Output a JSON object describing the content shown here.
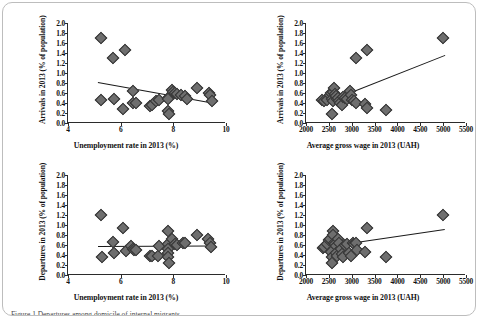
{
  "figure": {
    "caption": "Figure 1 Departures among domicile of internal migrants",
    "panel_count": 4
  },
  "chart_data": [
    {
      "id": "arrivals-vs-unemployment",
      "type": "scatter",
      "position": "top-left",
      "title": "",
      "xlabel": "Unemployment rate in 2013 (%)",
      "ylabel": "Arrivals in 2013  (% of population)",
      "xlim": [
        4,
        10
      ],
      "ylim": [
        0,
        2.0
      ],
      "xticks": [
        4,
        6,
        8,
        10
      ],
      "yticks": [
        0.0,
        0.2,
        0.4,
        0.6,
        0.8,
        1.0,
        1.2,
        1.4,
        1.6,
        1.8,
        2.0
      ],
      "grid": false,
      "legend": "none",
      "marker": "diamond",
      "points": [
        {
          "x": 5.25,
          "y": 1.71
        },
        {
          "x": 5.7,
          "y": 1.3
        },
        {
          "x": 6.15,
          "y": 1.46
        },
        {
          "x": 5.25,
          "y": 0.47
        },
        {
          "x": 5.75,
          "y": 0.49
        },
        {
          "x": 6.1,
          "y": 0.29
        },
        {
          "x": 6.45,
          "y": 0.65
        },
        {
          "x": 6.45,
          "y": 0.4
        },
        {
          "x": 6.6,
          "y": 0.4
        },
        {
          "x": 7.1,
          "y": 0.35
        },
        {
          "x": 7.2,
          "y": 0.37
        },
        {
          "x": 7.35,
          "y": 0.45
        },
        {
          "x": 7.45,
          "y": 0.47
        },
        {
          "x": 7.8,
          "y": 0.5
        },
        {
          "x": 7.8,
          "y": 0.49
        },
        {
          "x": 7.8,
          "y": 0.24
        },
        {
          "x": 7.82,
          "y": 0.18
        },
        {
          "x": 7.95,
          "y": 0.66
        },
        {
          "x": 7.98,
          "y": 0.63
        },
        {
          "x": 8.05,
          "y": 0.6
        },
        {
          "x": 8.15,
          "y": 0.58
        },
        {
          "x": 8.3,
          "y": 0.56
        },
        {
          "x": 8.45,
          "y": 0.55
        },
        {
          "x": 8.5,
          "y": 0.48
        },
        {
          "x": 8.9,
          "y": 0.7
        },
        {
          "x": 9.35,
          "y": 0.6
        },
        {
          "x": 9.4,
          "y": 0.56
        },
        {
          "x": 9.45,
          "y": 0.45
        }
      ],
      "trendline": {
        "x1": 5.15,
        "y1": 0.82,
        "x2": 9.5,
        "y2": 0.41
      }
    },
    {
      "id": "arrivals-vs-wage",
      "type": "scatter",
      "position": "top-right",
      "title": "",
      "xlabel": "Average gross wage in 2013 (UAH)",
      "ylabel": "Arrivals in 2013  (% of population)",
      "xlim": [
        2000,
        5500
      ],
      "ylim": [
        0,
        2.0
      ],
      "xticks": [
        2000,
        2500,
        3000,
        3500,
        4000,
        4500,
        5000,
        5500
      ],
      "yticks": [
        0.0,
        0.2,
        0.4,
        0.6,
        0.8,
        1.0,
        1.2,
        1.4,
        1.6,
        1.8,
        2.0
      ],
      "grid": false,
      "legend": "none",
      "marker": "diamond",
      "points": [
        {
          "x": 5000,
          "y": 1.71
        },
        {
          "x": 3100,
          "y": 1.3
        },
        {
          "x": 3330,
          "y": 1.46
        },
        {
          "x": 2360,
          "y": 0.47
        },
        {
          "x": 2400,
          "y": 0.45
        },
        {
          "x": 2460,
          "y": 0.47
        },
        {
          "x": 2520,
          "y": 0.56
        },
        {
          "x": 2540,
          "y": 0.6
        },
        {
          "x": 2560,
          "y": 0.49
        },
        {
          "x": 2580,
          "y": 0.45
        },
        {
          "x": 2600,
          "y": 0.63
        },
        {
          "x": 2620,
          "y": 0.7
        },
        {
          "x": 2640,
          "y": 0.58
        },
        {
          "x": 2650,
          "y": 0.55
        },
        {
          "x": 2680,
          "y": 0.48
        },
        {
          "x": 2700,
          "y": 0.5
        },
        {
          "x": 2720,
          "y": 0.44
        },
        {
          "x": 2750,
          "y": 0.4
        },
        {
          "x": 2780,
          "y": 0.37
        },
        {
          "x": 2820,
          "y": 0.52
        },
        {
          "x": 2860,
          "y": 0.5
        },
        {
          "x": 2900,
          "y": 0.49
        },
        {
          "x": 2960,
          "y": 0.65
        },
        {
          "x": 2980,
          "y": 0.56
        },
        {
          "x": 3000,
          "y": 0.47
        },
        {
          "x": 3050,
          "y": 0.45
        },
        {
          "x": 3100,
          "y": 0.4
        },
        {
          "x": 3300,
          "y": 0.38
        },
        {
          "x": 3330,
          "y": 0.3
        },
        {
          "x": 2560,
          "y": 0.18
        },
        {
          "x": 3750,
          "y": 0.26
        }
      ],
      "trendline": {
        "x1": 2980,
        "y1": 0.62,
        "x2": 5030,
        "y2": 1.36
      }
    },
    {
      "id": "departures-vs-unemployment",
      "type": "scatter",
      "position": "bottom-left",
      "title": "",
      "xlabel": "Unemployment rate in 2013 (%)",
      "ylabel": "Departures in 2013 (% of population)",
      "xlim": [
        4,
        10
      ],
      "ylim": [
        0,
        2.0
      ],
      "xticks": [
        4,
        6,
        8,
        10
      ],
      "yticks": [
        0.0,
        0.2,
        0.4,
        0.6,
        0.8,
        1.0,
        1.2,
        1.4,
        1.6,
        1.8,
        2.0
      ],
      "grid": false,
      "legend": "none",
      "marker": "diamond",
      "points": [
        {
          "x": 5.25,
          "y": 1.21
        },
        {
          "x": 5.3,
          "y": 0.37
        },
        {
          "x": 5.7,
          "y": 0.67
        },
        {
          "x": 5.75,
          "y": 0.45
        },
        {
          "x": 6.1,
          "y": 0.95
        },
        {
          "x": 6.2,
          "y": 0.48
        },
        {
          "x": 6.4,
          "y": 0.59
        },
        {
          "x": 6.45,
          "y": 0.52
        },
        {
          "x": 6.5,
          "y": 0.5
        },
        {
          "x": 6.6,
          "y": 0.5
        },
        {
          "x": 7.1,
          "y": 0.38
        },
        {
          "x": 7.2,
          "y": 0.38
        },
        {
          "x": 7.4,
          "y": 0.38
        },
        {
          "x": 7.45,
          "y": 0.59
        },
        {
          "x": 7.8,
          "y": 0.88
        },
        {
          "x": 7.8,
          "y": 0.62
        },
        {
          "x": 7.8,
          "y": 0.52
        },
        {
          "x": 7.8,
          "y": 0.44
        },
        {
          "x": 7.8,
          "y": 0.36
        },
        {
          "x": 7.82,
          "y": 0.25
        },
        {
          "x": 7.95,
          "y": 0.72
        },
        {
          "x": 8.05,
          "y": 0.63
        },
        {
          "x": 8.15,
          "y": 0.6
        },
        {
          "x": 8.35,
          "y": 0.65
        },
        {
          "x": 8.45,
          "y": 0.65
        },
        {
          "x": 8.9,
          "y": 0.8
        },
        {
          "x": 9.3,
          "y": 0.72
        },
        {
          "x": 9.4,
          "y": 0.65
        },
        {
          "x": 9.42,
          "y": 0.57
        }
      ],
      "trendline": {
        "x1": 5.15,
        "y1": 0.59,
        "x2": 9.5,
        "y2": 0.6
      }
    },
    {
      "id": "departures-vs-wage",
      "type": "scatter",
      "position": "bottom-right",
      "title": "",
      "xlabel": "Average gross wage in 2013 (UAH)",
      "ylabel": "Departures in 2013 (% of population)",
      "xlim": [
        2000,
        5500
      ],
      "ylim": [
        0,
        2.0
      ],
      "xticks": [
        2000,
        2500,
        3000,
        3500,
        4000,
        4500,
        5000,
        5500
      ],
      "yticks": [
        0.0,
        0.2,
        0.4,
        0.6,
        0.8,
        1.0,
        1.2,
        1.4,
        1.6,
        1.8,
        2.0
      ],
      "grid": false,
      "legend": "none",
      "marker": "diamond",
      "points": [
        {
          "x": 5000,
          "y": 1.21
        },
        {
          "x": 3330,
          "y": 0.95
        },
        {
          "x": 2370,
          "y": 0.55
        },
        {
          "x": 2400,
          "y": 0.57
        },
        {
          "x": 2460,
          "y": 0.62
        },
        {
          "x": 2500,
          "y": 0.7
        },
        {
          "x": 2520,
          "y": 0.72
        },
        {
          "x": 2540,
          "y": 0.47
        },
        {
          "x": 2560,
          "y": 0.37
        },
        {
          "x": 2580,
          "y": 0.88
        },
        {
          "x": 2600,
          "y": 0.8
        },
        {
          "x": 2620,
          "y": 0.65
        },
        {
          "x": 2640,
          "y": 0.63
        },
        {
          "x": 2650,
          "y": 0.58
        },
        {
          "x": 2660,
          "y": 0.44
        },
        {
          "x": 2680,
          "y": 0.38
        },
        {
          "x": 2700,
          "y": 0.72
        },
        {
          "x": 2720,
          "y": 0.65
        },
        {
          "x": 2760,
          "y": 0.52
        },
        {
          "x": 2790,
          "y": 0.42
        },
        {
          "x": 2820,
          "y": 0.36
        },
        {
          "x": 2860,
          "y": 0.6
        },
        {
          "x": 2900,
          "y": 0.63
        },
        {
          "x": 2950,
          "y": 0.45
        },
        {
          "x": 2980,
          "y": 0.38
        },
        {
          "x": 3020,
          "y": 0.65
        },
        {
          "x": 3060,
          "y": 0.62
        },
        {
          "x": 3100,
          "y": 0.64
        },
        {
          "x": 3120,
          "y": 0.5
        },
        {
          "x": 2560,
          "y": 0.25
        },
        {
          "x": 3300,
          "y": 0.47
        },
        {
          "x": 3750,
          "y": 0.37
        }
      ],
      "trendline": {
        "x1": 2350,
        "y1": 0.57,
        "x2": 5040,
        "y2": 0.93
      }
    }
  ]
}
